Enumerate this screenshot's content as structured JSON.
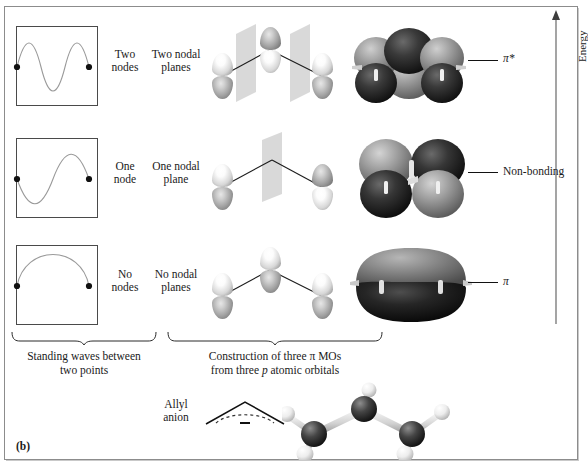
{
  "figure": {
    "panel_tag": "(b)",
    "energy_axis": {
      "label": "Energy",
      "direction": "up",
      "arrow": "arrow-up"
    }
  },
  "rows": [
    {
      "id": "antibonding",
      "wave_label": "Two\nnodes",
      "nodal_label": "Two nodal\nplanes",
      "level_label": "π*",
      "wave_nodes": 2,
      "nodal_planes": 2,
      "p_orbitals": 3,
      "mo_lobes": 6
    },
    {
      "id": "nonbonding",
      "wave_label": "One\nnode",
      "nodal_label": "One nodal\nplane",
      "level_label": "Non-bonding",
      "wave_nodes": 1,
      "nodal_planes": 1,
      "p_orbitals": 2,
      "mo_lobes": 4
    },
    {
      "id": "bonding",
      "wave_label": "No\nnodes",
      "nodal_label": "No nodal\nplanes",
      "level_label": "π",
      "wave_nodes": 0,
      "nodal_planes": 0,
      "p_orbitals": 3,
      "mo_lobes": 2
    }
  ],
  "captions": {
    "left": "Standing waves between\ntwo points",
    "right_line1": "Construction of three π MOs",
    "right_line2_pre": "from three ",
    "right_line2_italic": "p",
    "right_line2_post": " atomic orbitals"
  },
  "allyl": {
    "label": "Allyl\nanion",
    "charge_symbol": "–",
    "model": "ball-and-stick allyl anion: 3 carbons, 5 hydrogens"
  }
}
